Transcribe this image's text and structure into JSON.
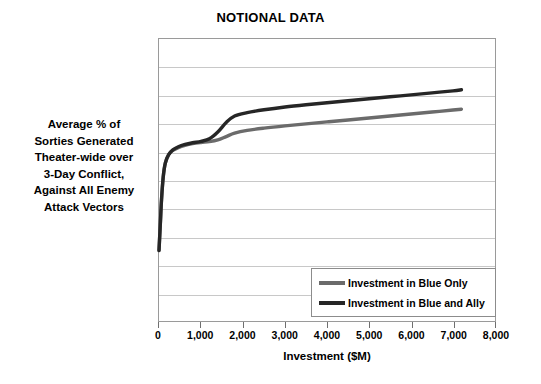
{
  "chart_data": {
    "type": "line",
    "title": "NOTIONAL DATA",
    "xlabel": "Investment ($M)",
    "ylabel": "Average % of Sorties Generated Theater-wide over 3-Day Conflict, Against All Enemy Attack Vectors",
    "ylabel_lines": [
      "Average % of",
      "Sorties Generated",
      "Theater-wide over",
      "3-Day Conflict,",
      "Against All Enemy",
      "Attack Vectors"
    ],
    "xlim": [
      0,
      8000
    ],
    "ylim": [
      0,
      100
    ],
    "xticks": [
      0,
      1000,
      2000,
      3000,
      4000,
      5000,
      6000,
      7000,
      8000
    ],
    "xtick_labels": [
      "0",
      "1,000",
      "2,000",
      "3,000",
      "4,000",
      "5,000",
      "6,000",
      "7,000",
      "8,000"
    ],
    "ytick_labels": [],
    "grid": "horizontal",
    "gridline_count": 9,
    "legend_position": "lower-right-inside",
    "series": [
      {
        "name": "Investment in Blue Only",
        "color": "#6b6b6b",
        "x": [
          0,
          30,
          60,
          100,
          150,
          230,
          330,
          460,
          620,
          800,
          1000,
          1200,
          1400,
          1600,
          1800,
          2100,
          2500,
          3000,
          3500,
          4000,
          4500,
          5000,
          5500,
          6000,
          6500,
          7000,
          7200
        ],
        "y": [
          25,
          34,
          43,
          51,
          56,
          59,
          60.5,
          61.5,
          62.3,
          62.9,
          63.3,
          63.6,
          64.2,
          65.4,
          66.6,
          67.6,
          68.4,
          69.2,
          69.9,
          70.6,
          71.3,
          72.0,
          72.7,
          73.4,
          74.1,
          74.8,
          75.1
        ]
      },
      {
        "name": "Investment in Blue and Ally",
        "color": "#262626",
        "x": [
          0,
          30,
          60,
          100,
          150,
          230,
          330,
          460,
          620,
          800,
          1000,
          1200,
          1400,
          1600,
          1800,
          2100,
          2500,
          3000,
          3500,
          4000,
          4500,
          5000,
          5500,
          6000,
          6500,
          7000,
          7200
        ],
        "y": [
          25,
          34,
          43,
          51,
          56,
          59,
          60.7,
          61.8,
          62.6,
          63.2,
          63.7,
          64.6,
          67.0,
          70.4,
          72.7,
          73.9,
          74.9,
          75.9,
          76.7,
          77.4,
          78.1,
          78.8,
          79.5,
          80.2,
          80.9,
          81.6,
          82.0
        ]
      }
    ]
  },
  "legend": {
    "entries": [
      {
        "label": "Investment in Blue Only",
        "color": "#6b6b6b"
      },
      {
        "label": "Investment in Blue and Ally",
        "color": "#262626"
      }
    ]
  }
}
